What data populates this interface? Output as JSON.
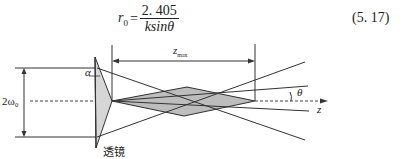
{
  "equation": {
    "lhs_symbol": "r",
    "lhs_subscript": "0",
    "equals": "=",
    "numerator": "2. 405",
    "denominator": "ksinθ",
    "number": "(5. 17)"
  },
  "figure": {
    "labels": {
      "beam_width": "2ω₀",
      "alpha": "α",
      "zmax_main": "z",
      "zmax_sub": "max",
      "theta": "θ",
      "axis": "z",
      "lens": "透镜"
    },
    "colors": {
      "line": "#333333",
      "shade": "#bdbdbd",
      "lens_fill": "#d6d6d6"
    }
  }
}
